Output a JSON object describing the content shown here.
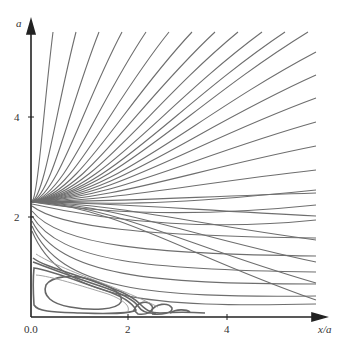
{
  "chart_data": {
    "type": "line",
    "title": "",
    "xlabel": "x/a",
    "ylabel": "a",
    "xlim": [
      0,
      5.9
    ],
    "ylim": [
      0,
      5.7
    ],
    "x_ticks": [
      {
        "value": 0,
        "label": "0.0"
      },
      {
        "value": 2,
        "label": "2"
      },
      {
        "value": 4,
        "label": "4"
      }
    ],
    "y_ticks": [
      {
        "value": 2,
        "label": "2"
      },
      {
        "value": 4,
        "label": "4"
      }
    ],
    "grid": false,
    "legend": null,
    "focal_point": {
      "x": 0.0,
      "y": 2.3
    },
    "vortex": {
      "center_x": 0.7,
      "center_y": 0.4,
      "extent_x": [
        0.0,
        2.0
      ],
      "extent_y": [
        0.0,
        1.3
      ]
    },
    "line_color": "#6e6e6e",
    "axis_color": "#222222"
  },
  "labels": {
    "x_axis": "x/a",
    "y_axis": "a",
    "tick_x0": "0.0",
    "tick_x2": "2",
    "tick_x4": "4",
    "tick_y2": "2",
    "tick_y4": "4"
  }
}
